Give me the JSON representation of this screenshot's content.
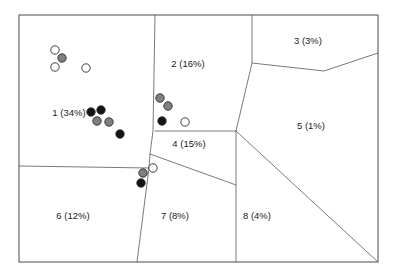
{
  "figure": {
    "title": "",
    "width": 397,
    "height": 277,
    "background_color": "#ffffff",
    "frame": {
      "x": 19,
      "y": 15,
      "width": 359,
      "height": 247,
      "stroke_color": "#4d4d4d"
    }
  },
  "chart_data": {
    "type": "scatter",
    "title": "",
    "xlabel": "",
    "ylabel": "",
    "grid": false,
    "legend_position": "none",
    "xlim": [
      19,
      378
    ],
    "ylim": [
      15,
      262
    ],
    "regions": [
      {
        "id": 1,
        "label": "1 (34%)",
        "percent": 34,
        "label_x": 69,
        "label_y": 113
      },
      {
        "id": 2,
        "label": "2 (16%)",
        "percent": 16,
        "label_x": 188,
        "label_y": 64
      },
      {
        "id": 3,
        "label": "3 (3%)",
        "percent": 3,
        "label_x": 308,
        "label_y": 41
      },
      {
        "id": 4,
        "label": "4 (15%)",
        "percent": 15,
        "label_x": 189,
        "label_y": 144
      },
      {
        "id": 5,
        "label": "5 (1%)",
        "percent": 1,
        "label_x": 311,
        "label_y": 126
      },
      {
        "id": 6,
        "label": "6 (12%)",
        "percent": 12,
        "label_x": 73,
        "label_y": 216
      },
      {
        "id": 7,
        "label": "7 (8%)",
        "percent": 8,
        "label_x": 175,
        "label_y": 216
      },
      {
        "id": 8,
        "label": "8 (4%)",
        "percent": 4,
        "label_x": 257,
        "label_y": 216
      }
    ],
    "cell_edges": [
      "M 155,15 L 153,131 L 150,154 L 149,168",
      "M 252,15 L 252,63 L 236,131",
      "M 252,63 L 324,71 L 378,53",
      "M 155,131 L 236,131",
      "M 150,154 L 236,185",
      "M 236,131 L 236,262",
      "M 236,131 L 378,262",
      "M 19,166 L 149,168",
      "M 149,168 L 137,262"
    ],
    "point_style": {
      "radius": 4.2,
      "fills": {
        "open": "#ffffff",
        "gray": "#808080",
        "black": "#141414"
      },
      "stroke": "#2b2b2b"
    },
    "points": [
      {
        "x": 55,
        "y": 50,
        "fill": "open",
        "cluster": 1
      },
      {
        "x": 62,
        "y": 58,
        "fill": "gray",
        "cluster": 1
      },
      {
        "x": 55,
        "y": 67,
        "fill": "open",
        "cluster": 1
      },
      {
        "x": 86,
        "y": 68,
        "fill": "open",
        "cluster": 1
      },
      {
        "x": 91,
        "y": 112,
        "fill": "black",
        "cluster": 1
      },
      {
        "x": 101,
        "y": 110,
        "fill": "black",
        "cluster": 1
      },
      {
        "x": 97,
        "y": 121,
        "fill": "gray",
        "cluster": 1
      },
      {
        "x": 109,
        "y": 122,
        "fill": "gray",
        "cluster": 1
      },
      {
        "x": 120,
        "y": 134,
        "fill": "black",
        "cluster": 1
      },
      {
        "x": 160,
        "y": 98,
        "fill": "gray",
        "cluster": 2
      },
      {
        "x": 168,
        "y": 106,
        "fill": "gray",
        "cluster": 2
      },
      {
        "x": 162,
        "y": 121,
        "fill": "black",
        "cluster": 2
      },
      {
        "x": 185,
        "y": 122,
        "fill": "open",
        "cluster": 2
      },
      {
        "x": 153,
        "y": 168,
        "fill": "open",
        "cluster": 4
      },
      {
        "x": 143,
        "y": 173,
        "fill": "gray",
        "cluster": 4
      },
      {
        "x": 141,
        "y": 183,
        "fill": "black",
        "cluster": 4
      }
    ]
  }
}
